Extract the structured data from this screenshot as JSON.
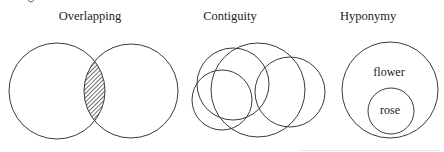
{
  "figure": {
    "panels": [
      {
        "id": "overlapping",
        "title": "Overlapping",
        "description": "Two overlapping circles with hatched intersection",
        "circles": [
          {
            "cx": 57,
            "cy": 91,
            "r": 48
          },
          {
            "cx": 131,
            "cy": 91,
            "r": 47
          }
        ],
        "hatched_region": "intersection"
      },
      {
        "id": "contiguity",
        "title": "Contiguity",
        "description": "Four mutually overlapping circles",
        "circles": [
          {
            "cx": 258,
            "cy": 90,
            "r": 47
          },
          {
            "cx": 233,
            "cy": 84,
            "r": 36
          },
          {
            "cx": 222,
            "cy": 100,
            "r": 30
          },
          {
            "cx": 290,
            "cy": 92,
            "r": 35
          }
        ]
      },
      {
        "id": "hyponymy",
        "title": "Hyponymy",
        "description": "Small circle nested inside large circle",
        "outer": {
          "cx": 390,
          "cy": 90,
          "r": 48,
          "label": "flower"
        },
        "inner": {
          "cx": 391,
          "cy": 111,
          "r": 23,
          "label": "rose"
        }
      }
    ],
    "colors": {
      "stroke": "#3a3a3a",
      "text": "#222222",
      "background": "#ffffff"
    }
  }
}
